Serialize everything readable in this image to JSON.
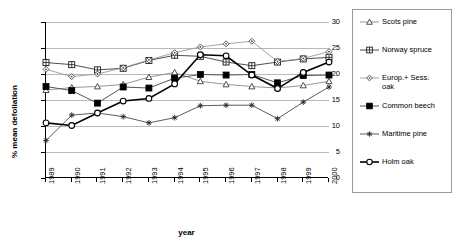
{
  "chart_data": {
    "type": "line",
    "title": "",
    "xlabel": "year",
    "ylabel": "% mean defoliation",
    "x": [
      1989,
      1990,
      1991,
      1992,
      1993,
      1994,
      1995,
      1996,
      1997,
      1998,
      1999,
      2000
    ],
    "categories": [
      "1989",
      "1990",
      "1991",
      "1992",
      "1993",
      "1994",
      "1995",
      "1996",
      "1997",
      "1998",
      "1999",
      "2000"
    ],
    "xlim": [
      1989,
      2000
    ],
    "ylim": [
      0,
      30
    ],
    "yticks": [
      0,
      5,
      10,
      15,
      20,
      25,
      30
    ],
    "grid": "horizontal",
    "legend_position": "right",
    "series": [
      {
        "name": "Scots pine",
        "marker": "triangle-open",
        "values": [
          16.9,
          17.4,
          17.6,
          18.0,
          19.4,
          20.3,
          18.6,
          18.0,
          17.6,
          17.3,
          17.8,
          18.6
        ]
      },
      {
        "name": "Norway spruce",
        "marker": "square-grid",
        "values": [
          22.2,
          21.8,
          20.8,
          21.1,
          22.6,
          23.6,
          23.4,
          22.3,
          21.6,
          22.3,
          22.9,
          23.2
        ]
      },
      {
        "name": "Europ.+ Sess. oak",
        "marker": "diamond-open",
        "values": [
          20.9,
          19.5,
          20.0,
          21.2,
          22.7,
          24.1,
          25.2,
          25.8,
          26.3,
          22.4,
          23.0,
          24.3
        ]
      },
      {
        "name": "Common beech",
        "marker": "square-filled",
        "values": [
          17.6,
          16.8,
          14.4,
          17.5,
          17.3,
          19.2,
          19.9,
          19.8,
          19.9,
          18.3,
          19.7,
          19.8
        ]
      },
      {
        "name": "Maritime pine",
        "marker": "star-x",
        "values": [
          7.2,
          12.1,
          12.5,
          11.8,
          10.6,
          11.6,
          13.9,
          14.0,
          14.0,
          11.4,
          14.6,
          17.5
        ]
      },
      {
        "name": "Holm oak",
        "marker": "circle-open",
        "values": [
          10.6,
          10.1,
          12.5,
          14.8,
          15.3,
          18.1,
          23.7,
          23.5,
          19.8,
          17.2,
          20.3,
          22.3
        ]
      }
    ]
  },
  "legend": {
    "items": [
      {
        "label": "Scots pine"
      },
      {
        "label": "Norway spruce"
      },
      {
        "label": "Europ.+ Sess.\noak"
      },
      {
        "label": "Common beech"
      },
      {
        "label": "Maritime pine"
      },
      {
        "label": "Holm oak"
      }
    ]
  }
}
